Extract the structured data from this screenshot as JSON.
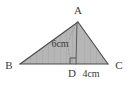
{
  "figure": {
    "type": "geometry-diagram",
    "shape": "triangle",
    "background_color": "#ffffff",
    "fill_color": "#b6b6b6",
    "stroke_color": "#4a4a4a",
    "label_color": "#3a3a3a"
  },
  "vertices": {
    "apex": {
      "label": "A",
      "x": 78,
      "y": 22,
      "label_x": 78,
      "label_y": 12
    },
    "left": {
      "label": "B",
      "x": 20,
      "y": 64,
      "label_x": 10,
      "label_y": 68
    },
    "right": {
      "label": "C",
      "x": 108,
      "y": 64,
      "label_x": 117,
      "label_y": 68
    },
    "foot": {
      "label": "D",
      "x": 76,
      "y": 64,
      "label_x": 71,
      "label_y": 76
    }
  },
  "measurements": [
    {
      "name": "altitude",
      "label": "6cm",
      "value": 6,
      "unit": "cm",
      "from": "A",
      "to": "D",
      "label_x": 60,
      "label_y": 46
    },
    {
      "name": "base-segment",
      "label": "4cm",
      "value": 4,
      "unit": "cm",
      "from": "D",
      "to": "C",
      "label_x": 90,
      "label_y": 76
    }
  ],
  "markers": {
    "right_angle": {
      "name": "right-angle-marker",
      "at": "D",
      "size": 6
    },
    "arc": {
      "name": "angle-arc",
      "from": "A",
      "to": "D"
    }
  },
  "edges": [
    {
      "name": "side-AB",
      "from": "A",
      "to": "B"
    },
    {
      "name": "side-AC",
      "from": "A",
      "to": "C"
    },
    {
      "name": "base-BC",
      "from": "B",
      "to": "C"
    },
    {
      "name": "altitude-AD",
      "from": "A",
      "to": "D"
    }
  ]
}
